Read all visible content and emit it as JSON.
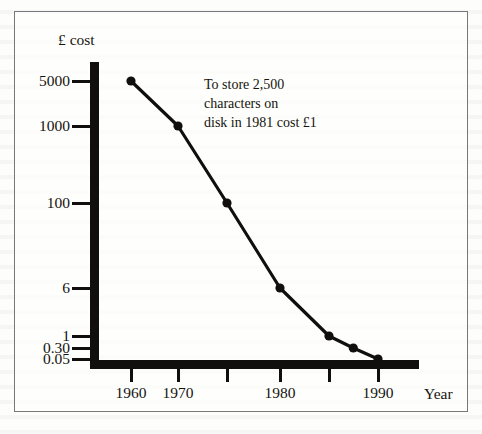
{
  "figure": {
    "annotation": "To store 2,500\ncharacters on\ndisk in 1981 cost £1",
    "annotation_lines": [
      "To store 2,500",
      "characters on",
      "disk in 1981 cost £1"
    ],
    "year_axis_title": "Year",
    "cost_axis_title": "£ cost",
    "ink_color": "#100f0d",
    "text_color": "#15140f",
    "frame_color": "#77777c",
    "background_color": "#fdfdfc"
  },
  "chart_data": {
    "type": "line",
    "title": "",
    "subtitle": "",
    "xlabel": "Year",
    "ylabel": "£ cost",
    "yscale": "log",
    "grid": false,
    "legend": null,
    "annotations": [
      {
        "text": "To store 2,500 characters on disk in 1981 cost £1",
        "x": 1981,
        "y": 1
      }
    ],
    "xlim": [
      1958,
      1992
    ],
    "ylim": [
      0.05,
      5000
    ],
    "x": [
      1960,
      1970,
      1975,
      1980,
      1985,
      1987,
      1990
    ],
    "values": [
      5000,
      1000,
      100,
      6,
      1,
      0.3,
      0.05
    ],
    "points": [
      {
        "x": 1960,
        "y": 5000
      },
      {
        "x": 1970,
        "y": 1000
      },
      {
        "x": 1975,
        "y": 100
      },
      {
        "x": 1980,
        "y": 6
      },
      {
        "x": 1985,
        "y": 1
      },
      {
        "x": 1987,
        "y": 0.3
      },
      {
        "x": 1990,
        "y": 0.05
      }
    ],
    "series": [
      {
        "name": "£ cost to store 2,500 characters on disk",
        "values": [
          5000,
          1000,
          100,
          6,
          1,
          0.3,
          0.05
        ]
      }
    ],
    "yticks": [
      {
        "label": "5000",
        "value": 5000,
        "px": 81
      },
      {
        "label": "1000",
        "value": 1000,
        "px": 126
      },
      {
        "label": "100",
        "value": 100,
        "px": 203
      },
      {
        "label": "6",
        "value": 6,
        "px": 288
      },
      {
        "label": "1",
        "value": 1,
        "px": 336
      },
      {
        "label": "0.30",
        "value": 0.3,
        "px": 348
      },
      {
        "label": "0.05",
        "value": 0.05,
        "px": 359
      }
    ],
    "xticks": [
      {
        "label": "1960",
        "value": 1960,
        "px": 131,
        "labeled": true
      },
      {
        "label": "1970",
        "value": 1970,
        "px": 178,
        "labeled": true
      },
      {
        "label": "",
        "value": 1975,
        "px": 227,
        "labeled": false
      },
      {
        "label": "1980",
        "value": 1980,
        "px": 280,
        "labeled": true
      },
      {
        "label": "",
        "value": 1985,
        "px": 329,
        "labeled": false
      },
      {
        "label": "1990",
        "value": 1990,
        "px": 378,
        "labeled": true
      }
    ]
  }
}
